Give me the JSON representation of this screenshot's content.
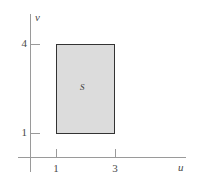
{
  "chart_data": {
    "type": "area",
    "title": "",
    "xlabel": "u",
    "ylabel": "v",
    "xlim": [
      0,
      4.7
    ],
    "ylim": [
      0,
      4.8
    ],
    "grid": false,
    "legend": null,
    "x_ticks": [
      "1",
      "3"
    ],
    "x_tick_values": [
      1,
      3
    ],
    "y_ticks": [
      "4",
      "1"
    ],
    "y_tick_values": [
      4,
      1
    ],
    "regions": [
      {
        "name": "S",
        "label": "S",
        "shape": "rectangle",
        "u_range": [
          1,
          3
        ],
        "v_range": [
          1,
          4
        ],
        "fill": "#dcdcdc",
        "stroke": "#333333"
      }
    ],
    "annotations": [
      {
        "text": "S",
        "u": 2,
        "v": 2.5
      }
    ]
  },
  "axes": {
    "x_name": "u",
    "y_name": "v",
    "x_tick_labels": [
      "1",
      "3"
    ],
    "y_tick_labels": [
      "4",
      "1"
    ],
    "axis_color": "#9a9a9a"
  },
  "region": {
    "label": "S",
    "fill_color": "#dcdcdc",
    "border_color": "#333333"
  }
}
